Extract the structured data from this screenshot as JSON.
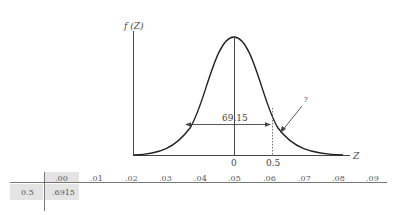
{
  "diagram": {
    "y_axis_label": "f (Z)",
    "x_axis_label": "Z",
    "x_ticks": [
      "0",
      "0.5"
    ],
    "area_label": "69.15",
    "unknown_label": "?"
  },
  "table": {
    "columns": [
      ".00",
      ".01",
      ".02",
      ".03",
      ".04",
      ".05",
      ".06",
      ".07",
      ".08",
      ".09"
    ],
    "rows": [
      {
        "z": "0.5",
        "values": [
          ".6915"
        ]
      }
    ],
    "highlight_color": "#e4e4e4"
  }
}
